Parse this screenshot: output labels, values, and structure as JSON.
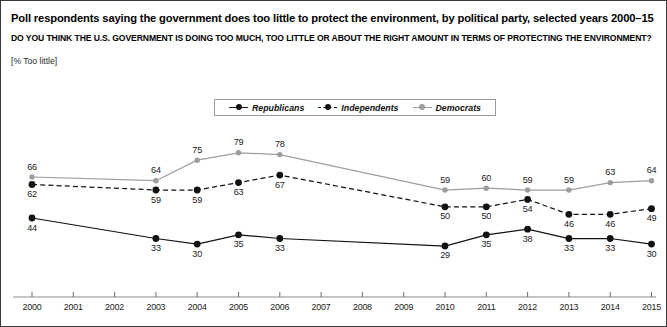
{
  "header": {
    "title": "Poll respondents saying the government does too little to protect the environment, by political party, selected years 2000–15",
    "subtitle": "DO YOU THINK THE U.S. GOVERNMENT IS DOING TOO MUCH, TOO LITTLE OR ABOUT THE RIGHT AMOUNT IN TERMS OF PROTECTING THE ENVIRONMENT?",
    "unit_label": "[% Too little]"
  },
  "legend": {
    "position": "top-center",
    "items": [
      {
        "label": "Republicans",
        "color": "#111111",
        "style": "solid",
        "marker": "circle"
      },
      {
        "label": "Independents",
        "color": "#111111",
        "style": "dashed",
        "marker": "circle"
      },
      {
        "label": "Democrats",
        "color": "#9d9d9d",
        "style": "solid",
        "marker": "circle"
      }
    ]
  },
  "chart_data": {
    "type": "line",
    "title": "Poll respondents saying the government does too little to protect the environment, by political party, selected years 2000–15",
    "subtitle": "DO YOU THINK THE U.S. GOVERNMENT IS DOING TOO MUCH, TOO LITTLE OR ABOUT THE RIGHT AMOUNT IN TERMS OF PROTECTING THE ENVIRONMENT?",
    "xlabel": "",
    "ylabel": "[% Too little]",
    "grid": false,
    "legend_position": "top-center",
    "axis_ticks": [
      "2000",
      "2001",
      "2002",
      "2003",
      "2004",
      "2005",
      "2006",
      "2007",
      "2008",
      "2009",
      "2010",
      "2011",
      "2012",
      "2013",
      "2014",
      "2015"
    ],
    "x": [
      2000,
      2003,
      2004,
      2005,
      2006,
      2010,
      2011,
      2012,
      2013,
      2014,
      2015
    ],
    "ylim": [
      0,
      100
    ],
    "series": [
      {
        "name": "Democrats",
        "color": "#9d9d9d",
        "style": "solid",
        "values": [
          66,
          64,
          75,
          79,
          78,
          59,
          60,
          59,
          59,
          63,
          64
        ],
        "label_side": "above"
      },
      {
        "name": "Independents",
        "color": "#111111",
        "style": "dashed",
        "values": [
          62,
          59,
          59,
          63,
          67,
          50,
          50,
          54,
          46,
          46,
          49
        ],
        "label_side": "below"
      },
      {
        "name": "Republicans",
        "color": "#111111",
        "style": "solid",
        "values": [
          44,
          33,
          30,
          35,
          33,
          29,
          35,
          38,
          33,
          33,
          30
        ],
        "label_side": "below"
      }
    ]
  }
}
